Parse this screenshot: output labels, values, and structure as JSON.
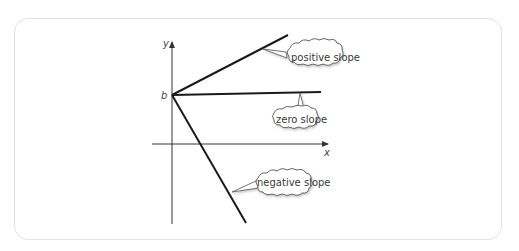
{
  "diagram": {
    "axes": {
      "x_label": "x",
      "y_label": "y",
      "intercept_label": "b"
    },
    "lines": [
      {
        "name": "positive",
        "label": "positive slope"
      },
      {
        "name": "zero",
        "label": "zero slope"
      },
      {
        "name": "negative",
        "label": "negative slope"
      }
    ],
    "colors": {
      "line": "#1a1a1a",
      "axis": "#333333",
      "frame": "#e2e2e2",
      "cloud_fill": "#ffffff",
      "cloud_stroke": "#555555"
    }
  }
}
